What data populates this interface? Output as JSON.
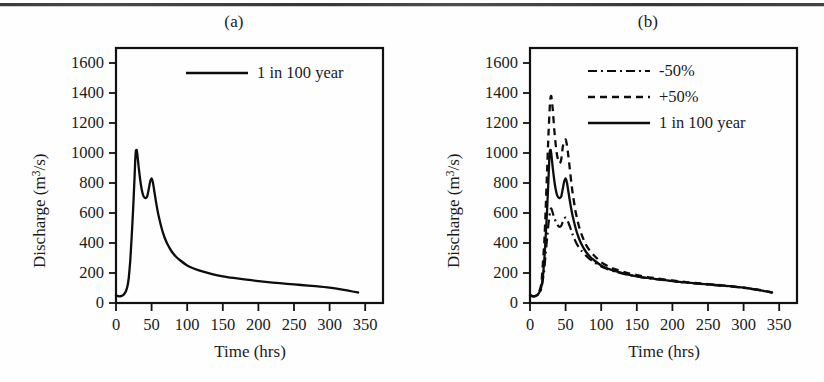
{
  "figure": {
    "panels": [
      {
        "id": "a",
        "label": "(a)",
        "xlabel": "Time (hrs)",
        "ylabel_prefix": "Discharge (m",
        "ylabel_sup": "3",
        "ylabel_suffix": "/s)",
        "legend": [
          {
            "name": "1 in 100 year",
            "style": "solid"
          }
        ]
      },
      {
        "id": "b",
        "label": "(b)",
        "xlabel": "Time (hrs)",
        "ylabel_prefix": "Discharge (m",
        "ylabel_sup": "3",
        "ylabel_suffix": "/s)",
        "legend": [
          {
            "name": "-50%",
            "style": "dashdot"
          },
          {
            "name": "+50%",
            "style": "dashed"
          },
          {
            "name": "1 in 100 year",
            "style": "solid"
          }
        ]
      }
    ]
  },
  "axes": {
    "y_ticks": [
      0,
      200,
      400,
      600,
      800,
      1000,
      1200,
      1400,
      1600
    ],
    "y_tick_labels": [
      "0",
      "200",
      "400",
      "600",
      "800",
      "1000",
      "1200",
      "1400",
      "1600"
    ],
    "x_ticks": [
      0,
      50,
      100,
      150,
      200,
      250,
      300,
      350
    ],
    "x_tick_labels": [
      "0",
      "50",
      "100",
      "150",
      "200",
      "250",
      "300",
      "350"
    ],
    "xlim": [
      0,
      375
    ],
    "ylim": [
      0,
      1700
    ],
    "grid": false,
    "line_color": "#111111"
  },
  "chart_data": [
    {
      "type": "line",
      "panel": "a",
      "title": "(a)",
      "xlabel": "Time (hrs)",
      "ylabel": "Discharge (m3/s)",
      "xlim": [
        0,
        375
      ],
      "ylim": [
        0,
        1700
      ],
      "grid": false,
      "legend_position": "top-right",
      "series": [
        {
          "name": "1 in 100 year",
          "style": "solid",
          "x": [
            0,
            2,
            4,
            6,
            8,
            10,
            12,
            14,
            16,
            18,
            20,
            22,
            24,
            26,
            27,
            28,
            29,
            30,
            32,
            34,
            36,
            38,
            40,
            42,
            44,
            46,
            48,
            50,
            52,
            54,
            56,
            58,
            60,
            64,
            68,
            72,
            78,
            84,
            90,
            100,
            110,
            120,
            135,
            150,
            165,
            180,
            200,
            220,
            240,
            260,
            280,
            300,
            320,
            340
          ],
          "y": [
            52,
            47,
            45,
            45,
            47,
            52,
            62,
            80,
            110,
            170,
            280,
            440,
            620,
            830,
            950,
            1015,
            1020,
            990,
            900,
            820,
            760,
            720,
            703,
            700,
            712,
            760,
            810,
            830,
            800,
            740,
            680,
            625,
            578,
            500,
            440,
            395,
            345,
            310,
            285,
            250,
            228,
            212,
            193,
            178,
            167,
            158,
            146,
            136,
            128,
            120,
            112,
            102,
            88,
            70
          ]
        }
      ]
    },
    {
      "type": "line",
      "panel": "b",
      "title": "(b)",
      "xlabel": "Time (hrs)",
      "ylabel": "Discharge (m3/s)",
      "xlim": [
        0,
        375
      ],
      "ylim": [
        0,
        1700
      ],
      "grid": false,
      "legend_position": "top-right",
      "series": [
        {
          "name": "-50%",
          "style": "dashdot",
          "x": [
            0,
            4,
            8,
            12,
            16,
            20,
            22,
            24,
            26,
            28,
            29,
            30,
            32,
            34,
            36,
            38,
            40,
            42,
            44,
            46,
            48,
            50,
            52,
            54,
            56,
            58,
            60,
            64,
            68,
            72,
            78,
            84,
            90,
            100,
            110,
            120,
            135,
            150,
            165,
            180,
            200,
            220,
            240,
            260,
            280,
            300,
            320,
            340
          ],
          "y": [
            50,
            45,
            47,
            58,
            95,
            220,
            330,
            430,
            530,
            605,
            625,
            630,
            600,
            570,
            545,
            525,
            512,
            508,
            515,
            540,
            562,
            570,
            558,
            535,
            510,
            482,
            455,
            410,
            375,
            350,
            318,
            292,
            272,
            243,
            224,
            209,
            191,
            177,
            166,
            157,
            145,
            135,
            127,
            119,
            111,
            101,
            87,
            69
          ]
        },
        {
          "name": "+50%",
          "style": "dashed",
          "x": [
            0,
            4,
            8,
            12,
            16,
            20,
            22,
            24,
            26,
            28,
            29,
            30,
            32,
            34,
            36,
            38,
            40,
            42,
            44,
            46,
            48,
            50,
            52,
            54,
            56,
            58,
            60,
            64,
            68,
            72,
            78,
            84,
            90,
            100,
            110,
            120,
            135,
            150,
            165,
            180,
            200,
            220,
            240,
            260,
            280,
            300,
            320,
            340
          ],
          "y": [
            54,
            46,
            48,
            66,
            130,
            400,
            620,
            880,
            1130,
            1330,
            1372,
            1378,
            1290,
            1160,
            1060,
            985,
            945,
            932,
            960,
            1040,
            1080,
            1090,
            1050,
            975,
            890,
            805,
            730,
            610,
            525,
            462,
            393,
            348,
            317,
            272,
            244,
            225,
            203,
            186,
            173,
            163,
            150,
            139,
            130,
            122,
            113,
            103,
            89,
            71
          ]
        },
        {
          "name": "1 in 100 year",
          "style": "solid",
          "x": [
            0,
            2,
            4,
            6,
            8,
            10,
            12,
            14,
            16,
            18,
            20,
            22,
            24,
            26,
            27,
            28,
            29,
            30,
            32,
            34,
            36,
            38,
            40,
            42,
            44,
            46,
            48,
            50,
            52,
            54,
            56,
            58,
            60,
            64,
            68,
            72,
            78,
            84,
            90,
            100,
            110,
            120,
            135,
            150,
            165,
            180,
            200,
            220,
            240,
            260,
            280,
            300,
            320,
            340
          ],
          "y": [
            52,
            47,
            45,
            45,
            47,
            52,
            62,
            80,
            110,
            170,
            280,
            440,
            620,
            830,
            950,
            1015,
            1020,
            990,
            900,
            820,
            760,
            720,
            703,
            700,
            712,
            760,
            810,
            830,
            800,
            740,
            680,
            625,
            578,
            500,
            440,
            395,
            345,
            310,
            285,
            250,
            228,
            212,
            193,
            178,
            167,
            158,
            146,
            136,
            128,
            120,
            112,
            102,
            88,
            70
          ]
        }
      ]
    }
  ]
}
